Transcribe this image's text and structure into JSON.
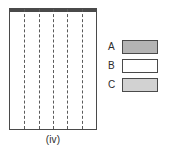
{
  "figure": {
    "caption": "(iv)",
    "colors": {
      "shade_a": "#b4b4b4",
      "shade_b": "#ffffff",
      "shade_c": "#d2d2d2",
      "outline": "#4a4a4a",
      "dash": "#5a5a5a",
      "background": "#ffffff"
    },
    "grid": {
      "columns": 6,
      "dashed_line_count": 5,
      "rows": [
        {
          "index": 1,
          "height_fraction": 0.246,
          "cells": [
            {
              "label": "row1-left",
              "width_fraction": 0.5,
              "shade": "C",
              "fill": "#d2d2d2",
              "divider_right": true
            },
            {
              "label": "row1-right",
              "width_fraction": 0.5,
              "shade": "B",
              "fill": "#ffffff",
              "divider_right": false
            }
          ]
        },
        {
          "index": 2,
          "height_fraction": 0.246,
          "cells": [
            {
              "label": "row2-left",
              "width_fraction": 0.3333,
              "shade": "B",
              "fill": "#ffffff",
              "divider_right": true
            },
            {
              "label": "row2-middle",
              "width_fraction": 0.3333,
              "shade": "A",
              "fill": "#b4b4b4",
              "divider_right": true
            },
            {
              "label": "row2-right",
              "width_fraction": 0.3334,
              "shade": "A",
              "fill": "#b4b4b4",
              "divider_right": false
            }
          ]
        },
        {
          "index": 3,
          "height_fraction": 0.246,
          "cells": [
            {
              "label": "row3-left",
              "width_fraction": 0.5,
              "shade": "A",
              "fill": "#b4b4b4",
              "divider_right": true
            },
            {
              "label": "row3-right",
              "width_fraction": 0.5,
              "shade": "B",
              "fill": "#ffffff",
              "divider_right": false
            }
          ]
        },
        {
          "index": 4,
          "height_fraction": 0.262,
          "cells": [
            {
              "label": "row4-full",
              "width_fraction": 1.0,
              "shade": "C",
              "fill": "#d2d2d2",
              "divider_right": false
            }
          ]
        }
      ]
    }
  },
  "legend": {
    "items": [
      {
        "label": "A",
        "fill": "#b4b4b4"
      },
      {
        "label": "B",
        "fill": "#ffffff"
      },
      {
        "label": "C",
        "fill": "#d2d2d2"
      }
    ]
  }
}
